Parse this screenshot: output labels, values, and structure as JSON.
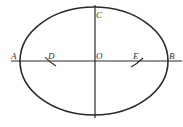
{
  "diagram": {
    "points": {
      "A": "A",
      "B": "B",
      "C": "C",
      "O": "O",
      "D": "D",
      "E": "E"
    },
    "colors": {
      "stroke": "#2a2a2a",
      "label": "#333333",
      "background": "#ffffff"
    }
  }
}
